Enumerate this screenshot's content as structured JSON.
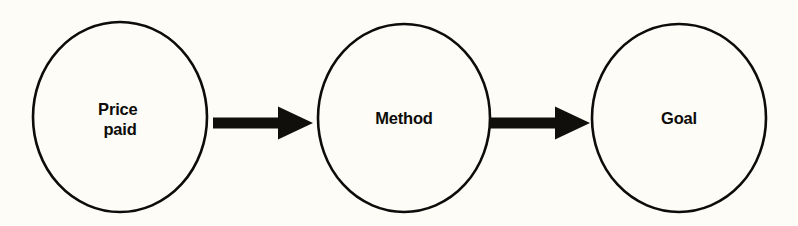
{
  "diagram": {
    "type": "flow-diagram",
    "background_color": "#fdfcf7",
    "stroke_color": "#0d0c0a",
    "arrow_color": "#100f0c",
    "nodes": [
      {
        "id": "price-paid",
        "shape": "ellipse",
        "lines": [
          "Price",
          "paid"
        ],
        "label": "Price paid",
        "cx": 120,
        "cy": 117,
        "rx": 87,
        "ry": 95
      },
      {
        "id": "method",
        "shape": "ellipse",
        "lines": [
          "Method"
        ],
        "label": "Method",
        "cx": 404,
        "cy": 118,
        "rx": 86,
        "ry": 94
      },
      {
        "id": "goal",
        "shape": "ellipse",
        "lines": [
          "Goal"
        ],
        "label": "Goal",
        "cx": 679,
        "cy": 118,
        "rx": 87,
        "ry": 94
      }
    ],
    "connectors": [
      {
        "id": "arrow-price-paid-to-method",
        "from": "price-paid",
        "to": "method",
        "direction": "right",
        "x_start": 213,
        "x_end": 313,
        "y_center": 123,
        "shaft_thickness": 11,
        "head_length": 35,
        "head_thickness": 33
      },
      {
        "id": "arrow-method-to-goal",
        "from": "method",
        "to": "goal",
        "direction": "right",
        "x_start": 490,
        "x_end": 590,
        "y_center": 123,
        "shaft_thickness": 11,
        "head_length": 35,
        "head_thickness": 33
      }
    ]
  }
}
